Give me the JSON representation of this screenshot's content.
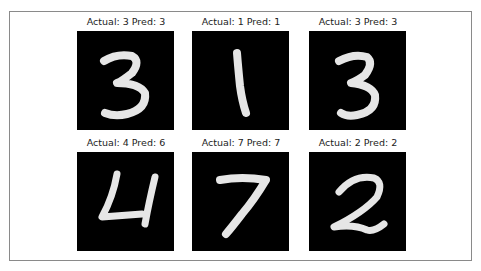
{
  "figure": {
    "panels": [
      {
        "title": "Actual: 3 Pred: 3",
        "actual": 3,
        "pred": 3,
        "digit_icon": "digit-3"
      },
      {
        "title": "Actual: 1 Pred: 1",
        "actual": 1,
        "pred": 1,
        "digit_icon": "digit-1"
      },
      {
        "title": "Actual: 3 Pred: 3",
        "actual": 3,
        "pred": 3,
        "digit_icon": "digit-3"
      },
      {
        "title": "Actual: 4 Pred: 6",
        "actual": 4,
        "pred": 6,
        "digit_icon": "digit-4"
      },
      {
        "title": "Actual: 7 Pred: 7",
        "actual": 7,
        "pred": 7,
        "digit_icon": "digit-7"
      },
      {
        "title": "Actual: 2 Pred: 2",
        "actual": 2,
        "pred": 2,
        "digit_icon": "digit-2"
      }
    ],
    "colors": {
      "background": "#ffffff",
      "image_bg": "#000000",
      "stroke": "#f2f2f2",
      "frame_border": "#8a8a8a"
    }
  }
}
